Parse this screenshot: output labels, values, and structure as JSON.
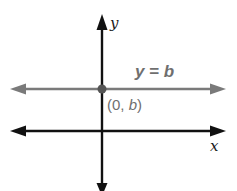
{
  "diagram": {
    "type": "coordinate-plane",
    "axes": {
      "x_label": "x",
      "y_label": "y",
      "color": "#111111"
    },
    "line": {
      "equation_label": "y = b",
      "equation_parts": {
        "lhs": "y",
        "eq": " = ",
        "rhs": "b"
      },
      "orientation": "horizontal",
      "color": "#7a7a7a"
    },
    "point": {
      "label": "(0, b)",
      "label_parts": {
        "open": "(0, ",
        "var": "b",
        "close": ")"
      },
      "color": "#555555"
    }
  }
}
